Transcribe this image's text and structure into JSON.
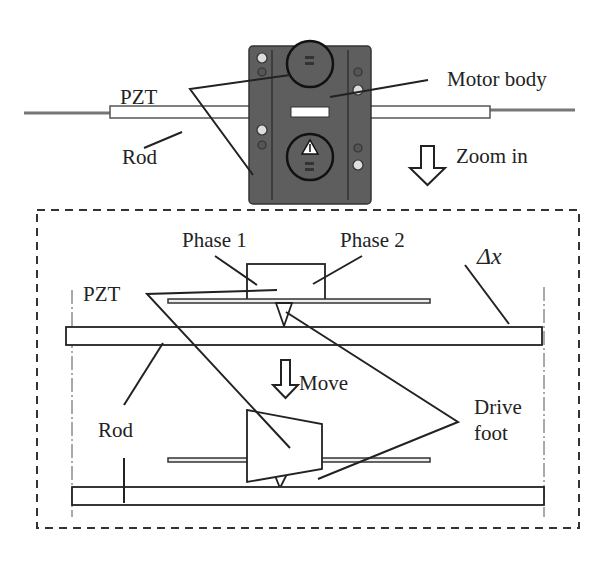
{
  "top": {
    "labels": {
      "pzt": "PZT",
      "motor_body": "Motor body",
      "rod": "Rod",
      "zoom_in": "Zoom in"
    }
  },
  "bottom": {
    "labels": {
      "phase1": "Phase 1",
      "phase2": "Phase 2",
      "delta_x": "Δx",
      "pzt": "PZT",
      "move": "Move",
      "rod": "Rod",
      "drive": "Drive",
      "foot": "foot"
    }
  },
  "colors": {
    "ink": "#222222",
    "motor_body": "#5e5e5e",
    "rod_gray": "#777777"
  }
}
